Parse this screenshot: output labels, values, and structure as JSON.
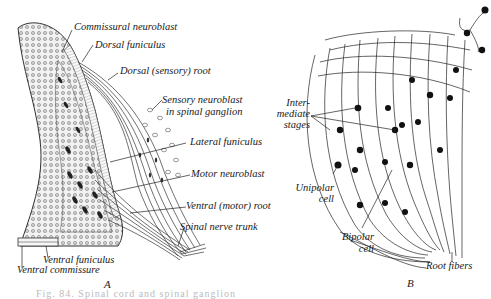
{
  "figure": {
    "panel_a": {
      "letter": "A",
      "labels": [
        {
          "id": "commissural-neuroblast",
          "text": "Commissural neuroblast"
        },
        {
          "id": "dorsal-funiculus",
          "text": "Dorsal funiculus"
        },
        {
          "id": "dorsal-sensory-root",
          "text": "Dorsal (sensory) root"
        },
        {
          "id": "sensory-neuroblast-1",
          "text": "Sensory neuroblast"
        },
        {
          "id": "sensory-neuroblast-2",
          "text": "in spinal ganglion"
        },
        {
          "id": "lateral-funiculus",
          "text": "Lateral funiculus"
        },
        {
          "id": "motor-neuroblast",
          "text": "Motor neuroblast"
        },
        {
          "id": "ventral-motor-root",
          "text": "Ventral (motor) root"
        },
        {
          "id": "spinal-nerve-trunk",
          "text": "Spinal nerve trunk"
        },
        {
          "id": "ventral-funiculus",
          "text": "Ventral funiculus"
        },
        {
          "id": "ventral-commissure",
          "text": "Ventral commissure"
        }
      ]
    },
    "panel_b": {
      "letter": "B",
      "labels": [
        {
          "id": "intermediate-1",
          "text": "Inter-"
        },
        {
          "id": "intermediate-2",
          "text": "mediate"
        },
        {
          "id": "intermediate-3",
          "text": "stages"
        },
        {
          "id": "unipolar-1",
          "text": "Unipolar"
        },
        {
          "id": "unipolar-2",
          "text": "cell"
        },
        {
          "id": "bipolar-1",
          "text": "Bipolar"
        },
        {
          "id": "bipolar-2",
          "text": "cell"
        },
        {
          "id": "root-fibers",
          "text": "Root fibers"
        }
      ]
    },
    "caption": "Fig. 84. Spinal cord and spinal ganglion"
  }
}
